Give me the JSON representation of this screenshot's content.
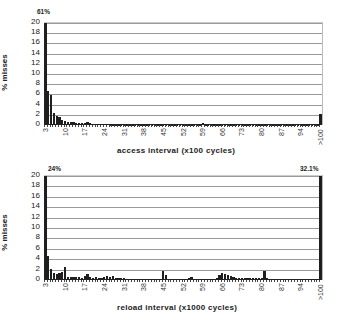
{
  "chart_data": [
    {
      "type": "bar",
      "title": "",
      "xlabel": "access interval (x100 cycles)",
      "ylabel": "% misses",
      "ylim": [
        0,
        20
      ],
      "yticks": [
        0,
        2,
        4,
        6,
        8,
        10,
        12,
        14,
        16,
        18,
        20
      ],
      "xtick_labels": [
        "3",
        "10",
        "17",
        "24",
        "31",
        "38",
        "45",
        "52",
        "59",
        "66",
        "73",
        "80",
        "87",
        "94",
        ">100"
      ],
      "grid": true,
      "legend": "none",
      "annotations": [
        {
          "text": "61%",
          "category": "3"
        }
      ],
      "categories": [
        "3",
        "4",
        "5",
        "6",
        "7",
        "8",
        "9",
        "10",
        "11",
        "12",
        "13",
        "14",
        "15",
        "16",
        "17",
        "18",
        "19",
        "20",
        "21",
        "22",
        "23",
        "24",
        "25",
        "26",
        "27",
        "28",
        "29",
        "30",
        "31",
        "32",
        "33",
        "34",
        "35",
        "36",
        "37",
        "38",
        "39",
        "40",
        "41",
        "42",
        "43",
        "44",
        "45",
        "46",
        "47",
        "48",
        "49",
        "50",
        "51",
        "52",
        "53",
        "54",
        "55",
        "56",
        "57",
        "58",
        "59",
        "60",
        "61",
        "62",
        "63",
        "64",
        "65",
        "66",
        "67",
        "68",
        "69",
        "70",
        "71",
        "72",
        "73",
        "74",
        "75",
        "76",
        "77",
        "78",
        "79",
        "80",
        "81",
        "82",
        "83",
        "84",
        "85",
        "86",
        "87",
        "88",
        "89",
        "90",
        "91",
        "92",
        "93",
        "94",
        "95",
        "96",
        "97",
        "98",
        "99",
        "100",
        ">100"
      ],
      "values": [
        61,
        6.6,
        5.8,
        2.4,
        1.7,
        1.6,
        0.9,
        0.7,
        0.6,
        0.6,
        0.5,
        0.4,
        0.4,
        0.3,
        0.3,
        0.5,
        0.3,
        0.2,
        0.2,
        0.2,
        0.2,
        0.15,
        0.15,
        0.1,
        0.1,
        0.1,
        0.1,
        0.1,
        0.1,
        0.1,
        0.1,
        0.1,
        0.1,
        0.1,
        0.1,
        0.1,
        0.1,
        0.1,
        0.1,
        0.1,
        0.1,
        0.1,
        0.1,
        0.1,
        0.1,
        0.1,
        0.1,
        0.1,
        0.1,
        0.1,
        0.1,
        0.1,
        0.1,
        0.1,
        0.1,
        0.1,
        0.3,
        0.1,
        0.1,
        0.1,
        0.1,
        0.1,
        0.1,
        0.1,
        0.1,
        0.1,
        0.1,
        0.1,
        0.1,
        0.1,
        0.1,
        0.1,
        0.1,
        0.1,
        0.1,
        0.1,
        0.1,
        0.1,
        0.1,
        0.1,
        0.1,
        0.1,
        0.1,
        0.1,
        0.1,
        0.1,
        0.1,
        0.1,
        0.1,
        0.1,
        0.1,
        0.1,
        0.1,
        0.1,
        0.1,
        0.1,
        0.1,
        0.1,
        2.1
      ]
    },
    {
      "type": "bar",
      "title": "",
      "xlabel": "reload interval (x1000 cycles)",
      "ylabel": "% misses",
      "ylim": [
        0,
        20
      ],
      "yticks": [
        0,
        2,
        4,
        6,
        8,
        10,
        12,
        14,
        16,
        18,
        20
      ],
      "xtick_labels": [
        "3",
        "10",
        "17",
        "24",
        "31",
        "38",
        "45",
        "52",
        "59",
        "66",
        "73",
        "80",
        "87",
        "94",
        ">100"
      ],
      "grid": true,
      "legend": "none",
      "annotations": [
        {
          "text": "24%",
          "category": "3"
        },
        {
          "text": "32.1%",
          "category": ">100"
        }
      ],
      "categories": [
        "3",
        "4",
        "5",
        "6",
        "7",
        "8",
        "9",
        "10",
        "11",
        "12",
        "13",
        "14",
        "15",
        "16",
        "17",
        "18",
        "19",
        "20",
        "21",
        "22",
        "23",
        "24",
        "25",
        "26",
        "27",
        "28",
        "29",
        "30",
        "31",
        "32",
        "33",
        "34",
        "35",
        "36",
        "37",
        "38",
        "39",
        "40",
        "41",
        "42",
        "43",
        "44",
        "45",
        "46",
        "47",
        "48",
        "49",
        "50",
        "51",
        "52",
        "53",
        "54",
        "55",
        "56",
        "57",
        "58",
        "59",
        "60",
        "61",
        "62",
        "63",
        "64",
        "65",
        "66",
        "67",
        "68",
        "69",
        "70",
        "71",
        "72",
        "73",
        "74",
        "75",
        "76",
        "77",
        "78",
        "79",
        "80",
        "81",
        "82",
        "83",
        "84",
        "85",
        "86",
        "87",
        "88",
        "89",
        "90",
        "91",
        "92",
        "93",
        "94",
        "95",
        "96",
        "97",
        "98",
        "99",
        "100",
        ">100"
      ],
      "values": [
        24,
        4.7,
        2.2,
        1.3,
        1.1,
        1.3,
        1.6,
        2.5,
        0.6,
        0.6,
        0.5,
        0.5,
        0.5,
        0.4,
        0.8,
        1.2,
        0.5,
        0.4,
        0.6,
        0.4,
        0.4,
        0.5,
        0.8,
        0.6,
        0.8,
        0.3,
        0.3,
        0.4,
        0.3,
        0.2,
        0.2,
        0.2,
        0.2,
        0.2,
        0.2,
        0.2,
        0.2,
        0.2,
        0.2,
        0.2,
        0.2,
        0.2,
        1.8,
        0.9,
        0.2,
        0.2,
        0.2,
        0.2,
        0.2,
        0.2,
        0.2,
        0.3,
        0.5,
        0.2,
        0.2,
        0.2,
        0.2,
        0.2,
        0.2,
        0.2,
        0.2,
        0.3,
        1.0,
        1.3,
        1.1,
        0.9,
        0.7,
        0.5,
        0.3,
        0.4,
        0.3,
        0.3,
        0.3,
        0.3,
        0.3,
        0.3,
        0.3,
        0.3,
        1.8,
        0.3,
        0.2,
        0.2,
        0.2,
        0.1,
        0.1,
        0.1,
        0.1,
        0.1,
        0.1,
        0.1,
        0.1,
        0.1,
        0.1,
        0.1,
        0.1,
        0.1,
        0.1,
        0.1,
        20
      ]
    }
  ]
}
